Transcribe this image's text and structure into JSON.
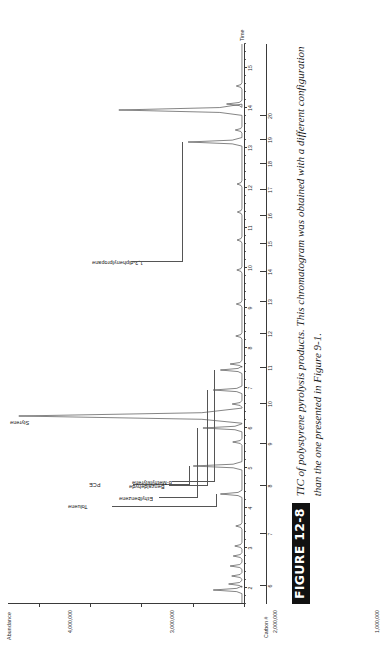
{
  "figure": {
    "tag": "FIGURE 12-8",
    "caption": "TIC of polystyrene pyrolysis products. This chromatogram was obtained with a different configuration than the one presented in Figure 9-1."
  },
  "chart_data": {
    "type": "line",
    "title": "",
    "ylabel": "Abundance",
    "xlabel": "Time",
    "secondary_xlabel": "Carbon #",
    "ylim": [
      0,
      4600000
    ],
    "yticks": [
      0,
      1000000,
      2000000,
      3000000,
      4000000
    ],
    "ytick_labels": [
      "0",
      "1,000,000",
      "2,000,000",
      "3,000,000",
      "4,000,000"
    ],
    "xlim": [
      1.6,
      15.6
    ],
    "xticks": [
      2,
      3,
      4,
      5,
      6,
      7,
      8,
      9,
      10,
      11,
      12,
      13,
      14,
      15
    ],
    "xtick_labels": [
      "2",
      "3",
      "4",
      "5",
      "6",
      "7",
      "8",
      "9",
      "10",
      "11",
      "12",
      "13",
      "14",
      "15"
    ],
    "secondary_xticks": [
      6,
      7,
      8,
      9,
      10,
      11,
      12,
      13,
      14,
      15,
      16,
      17,
      18,
      19,
      20
    ],
    "secondary_xtick_labels": [
      "6",
      "7",
      "8",
      "9",
      "10",
      "11",
      "12",
      "13",
      "14",
      "15",
      "16",
      "17",
      "18",
      "19",
      "20"
    ],
    "secondary_x_positions_time": [
      2.05,
      3.35,
      4.55,
      5.6,
      6.6,
      7.5,
      8.35,
      9.15,
      9.9,
      10.6,
      11.3,
      11.95,
      12.6,
      13.2,
      13.8
    ],
    "grid": false,
    "legend": false,
    "annotations": [
      {
        "label": "Toluene",
        "time": 4.35,
        "abundance": 420000
      },
      {
        "label": "PCE",
        "time": 5.05,
        "abundance": 950000
      },
      {
        "label": "Styrene",
        "time": 6.3,
        "abundance": 4350000
      },
      {
        "label": "Ethylbenzene",
        "time": 6.0,
        "abundance": 760000
      },
      {
        "label": "Benzaldehyde",
        "time": 6.95,
        "abundance": 560000
      },
      {
        "label": "α-Methylstyrene",
        "time": 7.45,
        "abundance": 420000
      },
      {
        "label": "1,3-diphenylpropane",
        "time": 13.15,
        "abundance": 1050000
      }
    ],
    "peaks": [
      {
        "time": 1.95,
        "abundance": 560000
      },
      {
        "time": 2.1,
        "abundance": 260000
      },
      {
        "time": 2.3,
        "abundance": 200000
      },
      {
        "time": 2.55,
        "abundance": 230000
      },
      {
        "time": 2.8,
        "abundance": 170000
      },
      {
        "time": 3.05,
        "abundance": 140000
      },
      {
        "time": 3.55,
        "abundance": 120000
      },
      {
        "time": 4.35,
        "abundance": 420000
      },
      {
        "time": 5.05,
        "abundance": 950000
      },
      {
        "time": 5.65,
        "abundance": 180000
      },
      {
        "time": 6.0,
        "abundance": 760000
      },
      {
        "time": 6.3,
        "abundance": 4350000
      },
      {
        "time": 6.6,
        "abundance": 190000
      },
      {
        "time": 6.95,
        "abundance": 560000
      },
      {
        "time": 7.45,
        "abundance": 420000
      },
      {
        "time": 7.6,
        "abundance": 230000
      },
      {
        "time": 8.3,
        "abundance": 120000
      },
      {
        "time": 9.1,
        "abundance": 110000
      },
      {
        "time": 9.95,
        "abundance": 100000
      },
      {
        "time": 10.7,
        "abundance": 95000
      },
      {
        "time": 11.4,
        "abundance": 90000
      },
      {
        "time": 12.1,
        "abundance": 95000
      },
      {
        "time": 13.15,
        "abundance": 1050000
      },
      {
        "time": 13.45,
        "abundance": 130000
      },
      {
        "time": 13.95,
        "abundance": 2400000
      },
      {
        "time": 14.1,
        "abundance": 300000
      },
      {
        "time": 14.55,
        "abundance": 110000
      }
    ]
  },
  "colors": {
    "trace": "#333333",
    "axis": "#3a3a3a",
    "text": "#1a1a1a",
    "tag_background": "#111111",
    "tag_text": "#ffffff",
    "page_background": "#ffffff"
  }
}
